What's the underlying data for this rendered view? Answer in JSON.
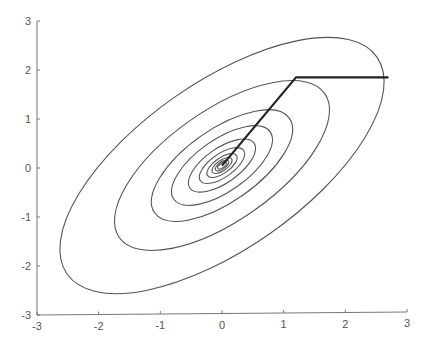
{
  "chart_data": {
    "type": "line",
    "subtype": "contour-with-descent-path",
    "title": "",
    "xlabel": "",
    "ylabel": "",
    "xlim": [
      -3,
      3
    ],
    "ylim": [
      -3,
      3
    ],
    "grid": false,
    "legend": null,
    "x_ticks": [
      -3,
      -2,
      -1,
      0,
      1,
      2,
      3
    ],
    "y_ticks": [
      -3,
      -2,
      -1,
      0,
      1,
      2,
      3
    ],
    "x_tick_labels": [
      "-3",
      "-2",
      "-1",
      "0",
      "1",
      "2",
      "3"
    ],
    "y_tick_labels": [
      "-3",
      "-2",
      "-1",
      "0",
      "1",
      "2",
      "3"
    ],
    "contours": {
      "shape": "rotated ellipses (elongated quadratic bowl)",
      "center": [
        0.0,
        0.05
      ],
      "rotation_deg": 35,
      "axis_ratio": 0.44,
      "relative_scales": [
        0.965,
        0.64,
        0.42,
        0.3,
        0.2,
        0.135,
        0.09,
        0.06,
        0.04,
        0.026
      ],
      "color": "#555555"
    },
    "series": [
      {
        "name": "optimization path",
        "x": [
          2.7,
          1.2,
          0.0
        ],
        "y": [
          1.85,
          1.85,
          0.05
        ],
        "color": "#222222"
      }
    ]
  },
  "colors": {
    "axis": "#777777",
    "contour": "#555555",
    "path": "#222222",
    "text": "#555555"
  }
}
